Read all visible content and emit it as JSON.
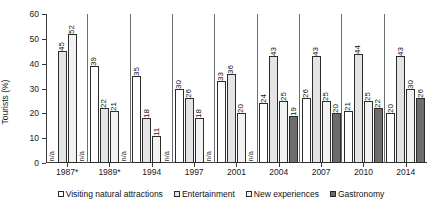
{
  "chart_data": {
    "type": "bar",
    "title": "",
    "xlabel": "",
    "ylabel": "Tourists (%)",
    "ylim": [
      0,
      60
    ],
    "yticks": [
      0,
      10,
      20,
      30,
      40,
      50,
      60
    ],
    "grid": false,
    "legend_position": "bottom",
    "categories": [
      "1987*",
      "1989*",
      "1994",
      "1997",
      "2001",
      "2004",
      "2007",
      "2010",
      "2014"
    ],
    "na_label": "n/a",
    "series": [
      {
        "name": "Visiting natural attractions",
        "color": "#ffffff",
        "values": [
          null,
          39,
          35,
          30,
          33,
          24,
          26,
          21,
          20
        ],
        "labels": [
          "n/a",
          "39",
          "35",
          "30",
          "33",
          "24",
          "26",
          "21",
          "20"
        ]
      },
      {
        "name": "Entertainment",
        "color": "#e4e4e4",
        "values": [
          45,
          22,
          18,
          26,
          36,
          43,
          43,
          44,
          43
        ],
        "labels": [
          "45",
          "22",
          "18",
          "26",
          "36",
          "43",
          "43",
          "44",
          "43"
        ]
      },
      {
        "name": "New experiences",
        "color": "#f2f2f2",
        "values": [
          52,
          21,
          11,
          18,
          20,
          25,
          25,
          25,
          30
        ],
        "labels": [
          "52",
          "21",
          "11",
          "18",
          "20",
          "25",
          "25",
          "25",
          "30"
        ]
      },
      {
        "name": "Gastronomy",
        "color": "#6d6d6d",
        "values": [
          null,
          null,
          null,
          null,
          null,
          19,
          20,
          22,
          26
        ],
        "labels": [
          "n/a",
          "n/a",
          "n/a",
          "n/a",
          "n/a",
          "19",
          "20",
          "22",
          "26"
        ]
      }
    ]
  }
}
